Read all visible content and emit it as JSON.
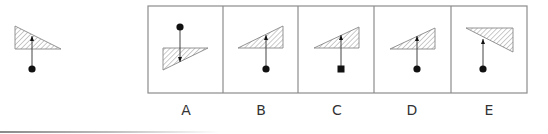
{
  "colors": {
    "stroke": "#444444",
    "frame": "#8c8c8c",
    "hatch": "#888888",
    "fill_marker": "#111111"
  },
  "reference": {
    "triangle": [
      [
        15,
        26
      ],
      [
        61,
        49
      ],
      [
        15,
        49
      ]
    ],
    "stem_x": 32,
    "marker": {
      "shape": "circle",
      "x": 32,
      "y": 69
    },
    "arrow": {
      "direction": "up",
      "tip_y": 36
    }
  },
  "options": [
    {
      "label": "A",
      "triangle": [
        [
          163,
          48
        ],
        [
          208,
          48
        ],
        [
          163,
          70
        ]
      ],
      "stem_x": 180,
      "marker": {
        "shape": "circle",
        "x": 180,
        "y": 27
      },
      "arrow": {
        "direction": "down",
        "tip_y": 62
      }
    },
    {
      "label": "B",
      "triangle": [
        [
          238,
          48
        ],
        [
          283,
          26
        ],
        [
          283,
          48
        ]
      ],
      "stem_x": 266,
      "marker": {
        "shape": "circle",
        "x": 266,
        "y": 69
      },
      "arrow": {
        "direction": "up",
        "tip_y": 35
      }
    },
    {
      "label": "C",
      "triangle": [
        [
          314,
          48
        ],
        [
          359,
          27
        ],
        [
          359,
          48
        ]
      ],
      "stem_x": 341,
      "marker": {
        "shape": "square",
        "x": 341,
        "y": 69
      },
      "arrow": {
        "direction": "up",
        "tip_y": 35
      }
    },
    {
      "label": "D",
      "triangle": [
        [
          390,
          49
        ],
        [
          435,
          28
        ],
        [
          435,
          49
        ]
      ],
      "stem_x": 417,
      "marker": {
        "shape": "circle",
        "x": 417,
        "y": 69
      },
      "arrow": {
        "direction": "up",
        "tip_y": 36
      }
    },
    {
      "label": "E",
      "triangle": [
        [
          466,
          28
        ],
        [
          513,
          28
        ],
        [
          513,
          52
        ]
      ],
      "stem_x": 483,
      "marker": {
        "shape": "circle",
        "x": 483,
        "y": 69
      },
      "arrow": {
        "direction": "up",
        "tip_y": 39
      }
    }
  ],
  "frame": {
    "x": 148,
    "y": 6,
    "width": 379,
    "height": 87,
    "dividers": [
      223,
      298,
      374,
      451
    ]
  }
}
